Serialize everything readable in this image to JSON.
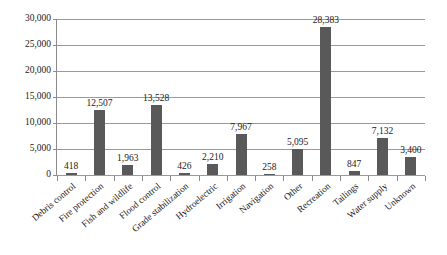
{
  "chart_data": {
    "type": "bar",
    "title": "",
    "subtitle": "",
    "xlabel": "",
    "ylabel": "",
    "ylim": [
      0,
      30000
    ],
    "ytick_values": [
      0,
      5000,
      10000,
      15000,
      20000,
      25000,
      30000
    ],
    "ytick_labels": [
      "0",
      "5,000",
      "10,000",
      "15,000",
      "20,000",
      "25,000",
      "30,000"
    ],
    "grid": "horizontal",
    "legend": "none",
    "bar_color": "#595959",
    "axis_color": "#8a8a8a",
    "gridline_color": "#9a9a9a",
    "categories": [
      "Debris control",
      "Fire protection",
      "Fish and wildlife",
      "Flood control",
      "Grade stabilization",
      "Hydroelectric",
      "Irrigation",
      "Navigation",
      "Other",
      "Recreation",
      "Tailings",
      "Water supply",
      "Unknown"
    ],
    "values": [
      418,
      12507,
      1963,
      13528,
      426,
      2210,
      7967,
      258,
      5095,
      28383,
      847,
      7132,
      3400
    ],
    "value_labels": [
      "418",
      "12,507",
      "1,963",
      "13,528",
      "426",
      "2,210",
      "7,967",
      "258",
      "5,095",
      "28,383",
      "847",
      "7,132",
      "3,400"
    ]
  }
}
